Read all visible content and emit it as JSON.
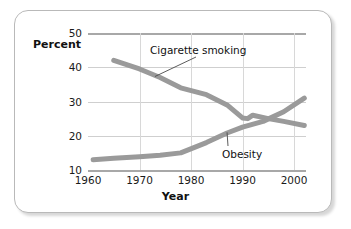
{
  "figure": {
    "frame_color": "#b9b9b9",
    "background": "#ffffff"
  },
  "chart_data": {
    "type": "line",
    "title": "",
    "xlabel": "Year",
    "ylabel": "Percent",
    "xlim": [
      1960,
      2003
    ],
    "ylim": [
      10,
      50
    ],
    "xticks": [
      1960,
      1970,
      1980,
      1990,
      2000
    ],
    "yticks": [
      10,
      20,
      30,
      40,
      50
    ],
    "xtick_labels": [
      "1960",
      "1970",
      "1980",
      "1990",
      "2000"
    ],
    "ytick_labels": [
      "10",
      "20",
      "30",
      "40",
      "50"
    ],
    "grid": true,
    "legend_position": "inline-annotations",
    "line_color": "#9a9a9a",
    "line_width": 5,
    "series": [
      {
        "name": "Cigarette smoking",
        "label_text": "Cigarette smoking",
        "x": [
          1965,
          1970,
          1974,
          1978,
          1983,
          1987,
          1990,
          1991,
          1992,
          1995,
          1998,
          2002
        ],
        "values": [
          42,
          39.5,
          37,
          34,
          32,
          29,
          25.2,
          25.0,
          26.0,
          25.0,
          24.2,
          23.0
        ]
      },
      {
        "name": "Obesity",
        "label_text": "Obesity",
        "x": [
          1961,
          1965,
          1970,
          1974,
          1978,
          1983,
          1987,
          1990,
          1994,
          1998,
          2002
        ],
        "values": [
          13.0,
          13.4,
          13.9,
          14.3,
          15.0,
          18.0,
          20.8,
          22.5,
          24.2,
          27.0,
          31.0
        ]
      }
    ],
    "annotations": [
      {
        "text": "Cigarette smoking",
        "points_to_x": 1973,
        "points_to_y": 37.3
      },
      {
        "text": "Obesity",
        "points_to_x": 1987,
        "points_to_y": 21.0
      }
    ]
  }
}
